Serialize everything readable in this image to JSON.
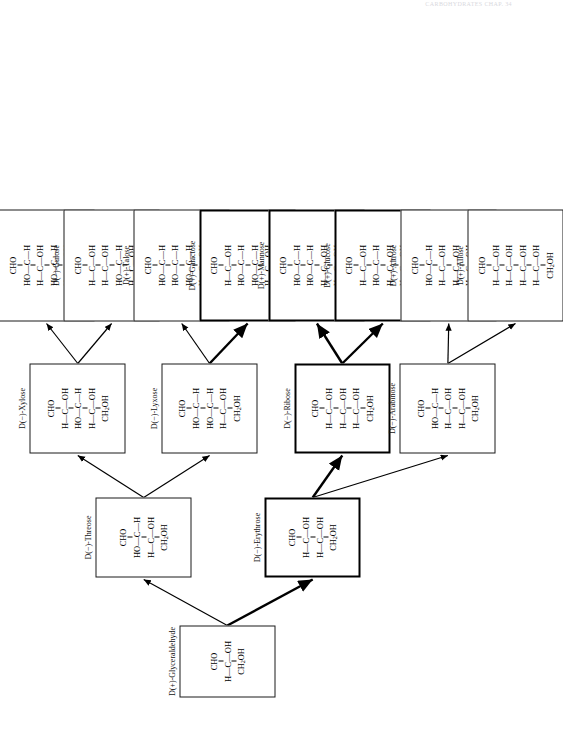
{
  "page": {
    "header_text": "CARBOHYDRATES  CHAP. 34"
  },
  "diagram": {
    "rotation_degrees": -90,
    "bond_glyphs": {
      "vertical": "|",
      "horizontal": "—"
    },
    "nodes": [
      {
        "id": "glyceraldehyde",
        "label": "D(+)-Glyceraldehyde",
        "level": 0,
        "carbons": 3,
        "bold": false,
        "top": "CHO",
        "bottom": "CH2OH",
        "centers": [
          {
            "left": "H",
            "right": "OH"
          }
        ]
      },
      {
        "id": "threose",
        "label": "D(−)-Threose",
        "level": 1,
        "carbons": 4,
        "bold": false,
        "top": "CHO",
        "bottom": "CH2OH",
        "centers": [
          {
            "left": "HO",
            "right": "H"
          },
          {
            "left": "H",
            "right": "OH"
          }
        ]
      },
      {
        "id": "erythrose",
        "label": "D(−)-Erythrose",
        "level": 1,
        "carbons": 4,
        "bold": true,
        "top": "CHO",
        "bottom": "CH2OH",
        "centers": [
          {
            "left": "H",
            "right": "OH"
          },
          {
            "left": "H",
            "right": "OH"
          }
        ]
      },
      {
        "id": "xylose",
        "label": "D(−)-Xylose",
        "level": 2,
        "carbons": 5,
        "bold": false,
        "top": "CHO",
        "bottom": "CH2OH",
        "centers": [
          {
            "left": "H",
            "right": "OH"
          },
          {
            "left": "HO",
            "right": "H"
          },
          {
            "left": "H",
            "right": "OH"
          }
        ]
      },
      {
        "id": "lyxose",
        "label": "D(−)-Lyxose",
        "level": 2,
        "carbons": 5,
        "bold": false,
        "top": "CHO",
        "bottom": "CH2OH",
        "centers": [
          {
            "left": "HO",
            "right": "H"
          },
          {
            "left": "HO",
            "right": "H"
          },
          {
            "left": "H",
            "right": "OH"
          }
        ]
      },
      {
        "id": "ribose",
        "label": "D(−)-Ribose",
        "level": 2,
        "carbons": 5,
        "bold": true,
        "top": "CHO",
        "bottom": "CH2OH",
        "centers": [
          {
            "left": "H",
            "right": "OH"
          },
          {
            "left": "H",
            "right": "OH"
          },
          {
            "left": "H",
            "right": "OH"
          }
        ]
      },
      {
        "id": "arabinose",
        "label": "D(−)-Arabinose",
        "level": 2,
        "carbons": 5,
        "bold": false,
        "top": "CHO",
        "bottom": "CH2OH",
        "centers": [
          {
            "left": "HO",
            "right": "H"
          },
          {
            "left": "H",
            "right": "OH"
          },
          {
            "left": "H",
            "right": "OH"
          }
        ]
      },
      {
        "id": "idose",
        "label": "D(−)-Idose",
        "level": 3,
        "carbons": 6,
        "bold": false,
        "top": "CHO",
        "bottom": "CH2OH",
        "centers": [
          {
            "left": "HO",
            "right": "H"
          },
          {
            "left": "H",
            "right": "OH"
          },
          {
            "left": "HO",
            "right": "H"
          },
          {
            "left": "H",
            "right": "OH"
          }
        ]
      },
      {
        "id": "gulose",
        "label": "D(−)-Gulose",
        "level": 3,
        "carbons": 6,
        "bold": false,
        "top": "CHO",
        "bottom": "CH2OH",
        "centers": [
          {
            "left": "H",
            "right": "OH"
          },
          {
            "left": "H",
            "right": "OH"
          },
          {
            "left": "HO",
            "right": "H"
          },
          {
            "left": "H",
            "right": "OH"
          }
        ]
      },
      {
        "id": "talose",
        "label": "D(+)-Talose",
        "level": 3,
        "carbons": 6,
        "bold": false,
        "top": "CHO",
        "bottom": "CH2OH",
        "centers": [
          {
            "left": "HO",
            "right": "H"
          },
          {
            "left": "HO",
            "right": "H"
          },
          {
            "left": "HO",
            "right": "H"
          },
          {
            "left": "H",
            "right": "OH"
          }
        ]
      },
      {
        "id": "galactose",
        "label": "D(+)-Galactose",
        "level": 3,
        "carbons": 6,
        "bold": true,
        "top": "CHO",
        "bottom": "CH2OH",
        "centers": [
          {
            "left": "H",
            "right": "OH"
          },
          {
            "left": "HO",
            "right": "H"
          },
          {
            "left": "HO",
            "right": "H"
          },
          {
            "left": "H",
            "right": "OH"
          }
        ]
      },
      {
        "id": "mannose",
        "label": "D(+)-Mannose",
        "level": 3,
        "carbons": 6,
        "bold": true,
        "top": "CHO",
        "bottom": "CH2OH",
        "centers": [
          {
            "left": "HO",
            "right": "H"
          },
          {
            "left": "HO",
            "right": "H"
          },
          {
            "left": "H",
            "right": "OH"
          },
          {
            "left": "H",
            "right": "OH"
          }
        ]
      },
      {
        "id": "glucose",
        "label": "D(+)-Glucose",
        "level": 3,
        "carbons": 6,
        "bold": true,
        "top": "CHO",
        "bottom": "CH2OH",
        "centers": [
          {
            "left": "H",
            "right": "OH"
          },
          {
            "left": "HO",
            "right": "H"
          },
          {
            "left": "H",
            "right": "OH"
          },
          {
            "left": "H",
            "right": "OH"
          }
        ]
      },
      {
        "id": "altrose",
        "label": "D(+)-Altrose",
        "level": 3,
        "carbons": 6,
        "bold": false,
        "top": "CHO",
        "bottom": "CH2OH",
        "centers": [
          {
            "left": "HO",
            "right": "H"
          },
          {
            "left": "H",
            "right": "OH"
          },
          {
            "left": "H",
            "right": "OH"
          },
          {
            "left": "H",
            "right": "OH"
          }
        ]
      },
      {
        "id": "allose",
        "label": "D(+)-Allose",
        "level": 3,
        "carbons": 6,
        "bold": false,
        "top": "CHO",
        "bottom": "CH2OH",
        "centers": [
          {
            "left": "H",
            "right": "OH"
          },
          {
            "left": "H",
            "right": "OH"
          },
          {
            "left": "H",
            "right": "OH"
          },
          {
            "left": "H",
            "right": "OH"
          }
        ]
      }
    ],
    "edges": [
      {
        "from": "glyceraldehyde",
        "to": "threose"
      },
      {
        "from": "glyceraldehyde",
        "to": "erythrose"
      },
      {
        "from": "threose",
        "to": "xylose"
      },
      {
        "from": "threose",
        "to": "lyxose"
      },
      {
        "from": "erythrose",
        "to": "ribose"
      },
      {
        "from": "erythrose",
        "to": "arabinose"
      },
      {
        "from": "xylose",
        "to": "idose"
      },
      {
        "from": "xylose",
        "to": "gulose"
      },
      {
        "from": "lyxose",
        "to": "talose"
      },
      {
        "from": "lyxose",
        "to": "galactose"
      },
      {
        "from": "ribose",
        "to": "mannose"
      },
      {
        "from": "ribose",
        "to": "glucose"
      },
      {
        "from": "arabinose",
        "to": "altrose"
      },
      {
        "from": "arabinose",
        "to": "allose"
      }
    ]
  }
}
